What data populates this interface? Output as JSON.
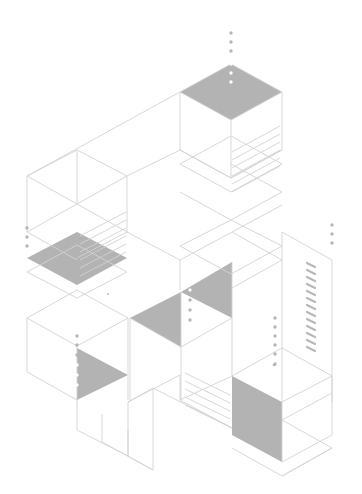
{
  "illustration": {
    "title": "Isometric cubes and layered plates line illustration",
    "background": "#ffffff",
    "line_color": "#d2d2d2",
    "shade_color": "#b3b3b3",
    "dot_color": "#b6b6b6"
  },
  "shaded": [
    {
      "name": "top-cube-top-face",
      "pts": "180,92 231,64 282,92 231,120"
    },
    {
      "name": "left-cube-plate",
      "pts": "27,258 77,232 127,258 77,285"
    },
    {
      "name": "mid-triangle-left",
      "pts": "130,318 181,292 181,347"
    },
    {
      "name": "mid-triangle-right",
      "pts": "181,292 232,262 232,318"
    },
    {
      "name": "lower-left-triangle",
      "pts": "77,348 77,400 128,375"
    },
    {
      "name": "lower-right-side-face",
      "pts": "232,376 282,402 282,462 232,435"
    }
  ],
  "lines": [
    "180,92 231,64 282,92 231,120 180,92",
    "180,92 180,150 231,178 231,120",
    "282,92 282,150 231,178",
    "180,150 231,178 282,150",
    "180,164 231,192 282,164 231,136 180,164",
    "180,192 231,220 282,192 231,164",
    "231,220 180,246 231,274 282,246 231,220",
    "27,176 180,92",
    "27,176 27,232 77,260",
    "27,176 77,150 127,176 77,204 27,176",
    "77,150 77,204",
    "127,176 127,232 77,258",
    "127,176 180,150",
    "127,232 180,260 180,290",
    "77,204 127,232",
    "27,232 77,204",
    "27,272 77,245 127,272 77,298 27,272",
    "27,318 77,290 128,318 77,346 27,318",
    "27,318 27,372 77,400",
    "77,346 77,400",
    "128,318 128,400",
    "77,400 77,430 128,456 128,402",
    "102,414 102,442 153,470 153,440",
    "128,430 128,456 153,470",
    "128,402 153,388 153,440",
    "128,402 180,375",
    "130,318 130,400",
    "181,292 181,347 130,318",
    "181,347 232,318",
    "181,347 181,400",
    "232,262 232,376",
    "180,260 232,232 282,260 232,288",
    "232,232 282,205",
    "282,232 282,402",
    "282,232 332,260 332,402",
    "232,376 282,348 332,376 282,402",
    "282,402 282,462",
    "282,462 332,435 332,376",
    "282,420 332,393",
    "282,420 332,448 282,476 232,448",
    "282,476 332,448",
    "180,375 180,400 232,428",
    "153,388 232,428",
    "180,400 232,376"
  ],
  "stripes": [
    {
      "group": "top-cube-side",
      "x1": 232,
      "x2": 280,
      "rows": [
        126,
        134,
        142,
        150,
        158,
        166
      ],
      "rise": 26
    },
    {
      "group": "left-cube-side",
      "x1": 80,
      "x2": 126,
      "rows": [
        212,
        220,
        228,
        236,
        244,
        252
      ],
      "rise": 24
    },
    {
      "group": "lower-steps",
      "x1": 185,
      "x2": 230,
      "rows": [
        395,
        403,
        411,
        419,
        427
      ],
      "rise": -22
    }
  ],
  "vent": {
    "x": 307,
    "y_start": 263,
    "count": 13,
    "gap": 7,
    "dx": 8,
    "dy": 4
  },
  "dots": [
    {
      "x": 231,
      "y": 33,
      "r": 1.7,
      "c": "dot"
    },
    {
      "x": 231,
      "y": 42,
      "r": 1.7,
      "c": "dot"
    },
    {
      "x": 231,
      "y": 51,
      "r": 1.7,
      "c": "dot"
    },
    {
      "x": 231,
      "y": 64,
      "r": 1.7,
      "c": "wdot"
    },
    {
      "x": 231,
      "y": 73,
      "r": 1.7,
      "c": "wdot"
    },
    {
      "x": 231,
      "y": 82,
      "r": 1.7,
      "c": "wdot"
    },
    {
      "x": 27,
      "y": 228,
      "r": 1.7,
      "c": "dot"
    },
    {
      "x": 27,
      "y": 237,
      "r": 1.7,
      "c": "dot"
    },
    {
      "x": 27,
      "y": 246,
      "r": 1.7,
      "c": "dot"
    },
    {
      "x": 332,
      "y": 225,
      "r": 1.7,
      "c": "dot"
    },
    {
      "x": 332,
      "y": 234,
      "r": 1.7,
      "c": "dot"
    },
    {
      "x": 332,
      "y": 243,
      "r": 1.7,
      "c": "dot"
    },
    {
      "x": 190,
      "y": 290,
      "r": 1.7,
      "c": "wdot"
    },
    {
      "x": 190,
      "y": 300,
      "r": 1.7,
      "c": "dot"
    },
    {
      "x": 190,
      "y": 310,
      "r": 1.7,
      "c": "dot"
    },
    {
      "x": 190,
      "y": 320,
      "r": 1.7,
      "c": "dot"
    },
    {
      "x": 77,
      "y": 336,
      "r": 1.7,
      "c": "dot"
    },
    {
      "x": 77,
      "y": 345,
      "r": 1.7,
      "c": "dot"
    },
    {
      "x": 77,
      "y": 355,
      "r": 1.7,
      "c": "dot"
    },
    {
      "x": 77,
      "y": 365,
      "r": 1.7,
      "c": "wdot"
    },
    {
      "x": 77,
      "y": 375,
      "r": 1.7,
      "c": "wdot"
    },
    {
      "x": 77,
      "y": 385,
      "r": 1.7,
      "c": "wdot"
    },
    {
      "x": 275,
      "y": 318,
      "r": 1.7,
      "c": "dot"
    },
    {
      "x": 275,
      "y": 327,
      "r": 1.7,
      "c": "dot"
    },
    {
      "x": 275,
      "y": 336,
      "r": 1.7,
      "c": "dot"
    },
    {
      "x": 275,
      "y": 345,
      "r": 1.7,
      "c": "dot"
    },
    {
      "x": 275,
      "y": 354,
      "r": 1.7,
      "c": "dot"
    },
    {
      "x": 275,
      "y": 364,
      "r": 1.7,
      "c": "dot"
    },
    {
      "x": 274,
      "y": 365,
      "r": 1.3,
      "c": "dot"
    },
    {
      "x": 108,
      "y": 294,
      "r": 0.9,
      "c": "dot"
    }
  ]
}
